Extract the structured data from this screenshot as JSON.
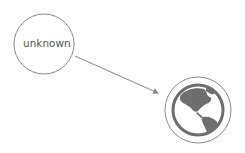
{
  "nodes": [
    {
      "id": "unknown",
      "label": "unknown",
      "type": "circle"
    },
    {
      "id": "internet",
      "label": "",
      "type": "globe-icon"
    }
  ],
  "edges": [
    {
      "from": "unknown",
      "to": "internet",
      "directed": true
    }
  ],
  "colors": {
    "stroke": "#8a8a8a",
    "globe": "#6e6e6e",
    "text": "#555555",
    "background": "#ffffff"
  }
}
